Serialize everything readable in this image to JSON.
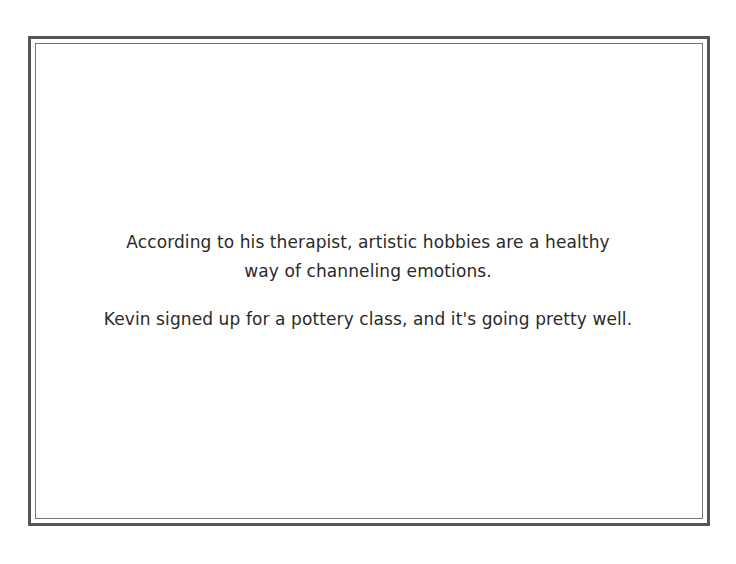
{
  "card": {
    "paragraphs": [
      {
        "lines": [
          "According to his therapist, artistic hobbies are a healthy",
          "way of channeling emotions."
        ]
      },
      {
        "lines": [
          "Kevin signed up for a pottery class, and it's going pretty well."
        ]
      }
    ]
  },
  "colors": {
    "border_outer": "#555555",
    "border_inner": "#777777",
    "text": "#2a2a2a",
    "background": "#ffffff"
  }
}
